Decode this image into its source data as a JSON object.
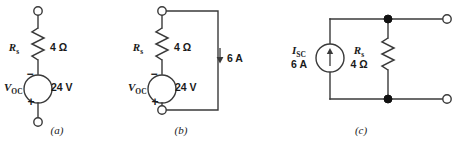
{
  "figure": {
    "background_color": "#ffffff",
    "line_color": "#3a3a3a",
    "node_color": "#111111",
    "width": 460,
    "height": 141
  },
  "circuits": [
    {
      "id": "circuit-a",
      "caption": "(a)",
      "caption_x": 57,
      "caption_y": 134,
      "type": "thevenin-equivalent",
      "resistor": {
        "symbol": "R",
        "subscript": "s",
        "value": "4 Ω",
        "symbol_x": 14,
        "symbol_y": 51,
        "value_x": 50,
        "value_y": 51
      },
      "source": {
        "symbol": "V",
        "subscript": "OC",
        "value": "24 V",
        "symbol_x": 4,
        "symbol_y": 91,
        "value_x": 51,
        "value_y": 91,
        "top_sign": "−",
        "bottom_sign": "+",
        "top_sign_x": 30,
        "top_sign_y": 74,
        "bottom_sign_x": 31,
        "bottom_sign_y": 104
      },
      "terminals": [
        {
          "name": "top-terminal",
          "x": 38,
          "y": 11,
          "r": 4.2
        },
        {
          "name": "bottom-terminal",
          "x": 38,
          "y": 122,
          "r": 4.2
        }
      ]
    },
    {
      "id": "circuit-b",
      "caption": "(b)",
      "caption_x": 181,
      "caption_y": 134,
      "type": "thevenin-with-load-current",
      "resistor": {
        "symbol": "R",
        "subscript": "s",
        "value": "4 Ω",
        "symbol_x": 138,
        "symbol_y": 51,
        "value_x": 174,
        "value_y": 51
      },
      "source": {
        "symbol": "V",
        "subscript": "OC",
        "value": "24 V",
        "symbol_x": 128,
        "symbol_y": 91,
        "value_x": 175,
        "value_y": 91,
        "top_sign": "−",
        "bottom_sign": "+",
        "top_sign_x": 154,
        "top_sign_y": 74,
        "bottom_sign_x": 155,
        "bottom_sign_y": 104
      },
      "terminals": [
        {
          "name": "top-terminal",
          "x": 162,
          "y": 11,
          "r": 4.2
        },
        {
          "name": "bottom-terminal",
          "x": 162,
          "y": 110,
          "r": 4.2
        }
      ],
      "current_arrow": {
        "label": "6 A",
        "direction": "down",
        "label_x": 228,
        "label_y": 62,
        "arrow_x": 220,
        "arrow_top_y": 48,
        "arrow_bottom_y": 63
      }
    },
    {
      "id": "circuit-c",
      "caption": "(c)",
      "caption_x": 361,
      "caption_y": 134,
      "type": "norton-equivalent",
      "resistor": {
        "symbol": "R",
        "subscript": "s",
        "value": "4 Ω",
        "symbol_x": 359,
        "symbol_y": 52,
        "value_x": 358,
        "value_y": 65
      },
      "source": {
        "symbol": "I",
        "subscript": "SC",
        "value": "6 A",
        "symbol_x": 299,
        "symbol_y": 54,
        "value_x": 299,
        "value_y": 67,
        "direction": "up"
      },
      "terminals": [
        {
          "name": "top-right-terminal",
          "x": 447,
          "y": 19,
          "r": 4.2
        },
        {
          "name": "bottom-right-terminal",
          "x": 447,
          "y": 99,
          "r": 4.2
        }
      ],
      "nodes": [
        {
          "name": "top-node",
          "x": 388,
          "y": 19,
          "r": 4.0
        },
        {
          "name": "bottom-node",
          "x": 388,
          "y": 99,
          "r": 4.0
        }
      ]
    }
  ]
}
